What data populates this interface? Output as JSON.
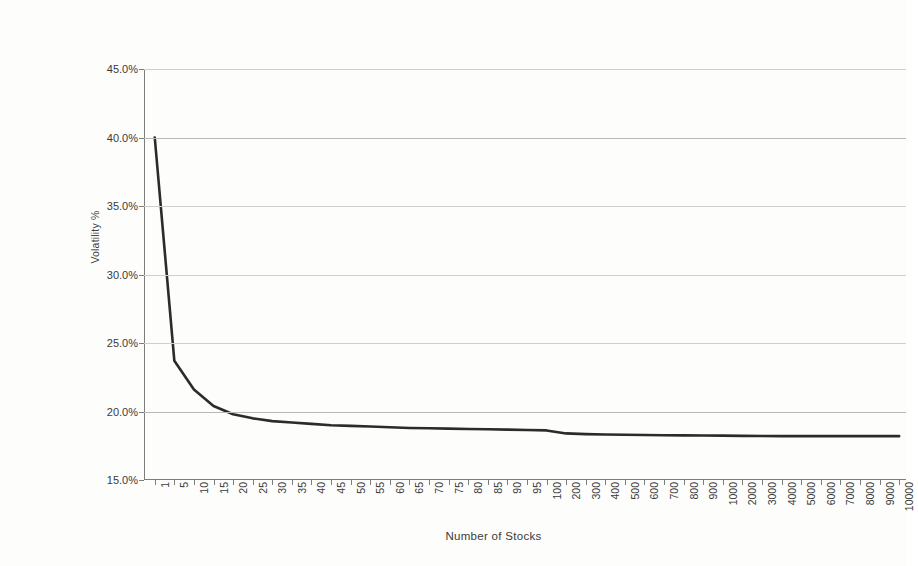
{
  "chart_data": {
    "type": "line",
    "title": "",
    "xlabel": "Number of Stocks",
    "ylabel": "Volatility %",
    "grid": true,
    "legend": false,
    "legend_position": "none",
    "line_color": "#2b2b2b",
    "gridline_color": "#cfcfcf",
    "axis_color": "#7d7d7d",
    "background_color": "#fdfdfc",
    "ylim": [
      15.0,
      45.0
    ],
    "ytick_step": 5.0,
    "ytick_labels": [
      "45.0%",
      "40.0%",
      "35.0%",
      "30.0%",
      "25.0%",
      "20.0%",
      "15.0%"
    ],
    "ytick_values": [
      45.0,
      40.0,
      35.0,
      30.0,
      25.0,
      20.0,
      15.0
    ],
    "x_axis_type": "category",
    "categories": [
      "1",
      "5",
      "10",
      "15",
      "20",
      "25",
      "30",
      "35",
      "40",
      "45",
      "50",
      "55",
      "60",
      "65",
      "70",
      "75",
      "80",
      "85",
      "90",
      "95",
      "100",
      "200",
      "300",
      "400",
      "500",
      "600",
      "700",
      "800",
      "900",
      "1000",
      "2000",
      "3000",
      "4000",
      "5000",
      "6000",
      "7000",
      "8000",
      "9000",
      "10000"
    ],
    "series": [
      {
        "name": "Portfolio Volatility",
        "values": [
          40.0,
          23.7,
          21.6,
          20.4,
          19.8,
          19.5,
          19.3,
          19.2,
          19.1,
          19.0,
          18.95,
          18.9,
          18.85,
          18.8,
          18.78,
          18.75,
          18.72,
          18.7,
          18.68,
          18.65,
          18.62,
          18.4,
          18.35,
          18.32,
          18.3,
          18.28,
          18.27,
          18.26,
          18.25,
          18.24,
          18.22,
          18.21,
          18.2,
          18.2,
          18.2,
          18.2,
          18.2,
          18.2,
          18.2
        ]
      }
    ],
    "annotations": []
  }
}
